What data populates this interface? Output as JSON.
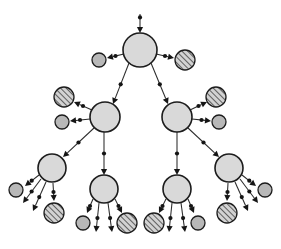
{
  "diagram": {
    "canvas": {
      "width": 281,
      "height": 249,
      "background": "#ffffff"
    },
    "style": {
      "big_node_fill": "#d9d9d9",
      "small_node_fill": "#b8b8b8",
      "hatch_stroke": "#4a4a4a",
      "hatch_background": "#d2d2d2",
      "node_stroke": "#1c1c1c",
      "edge_stroke": "#2b2b2b",
      "marker_fill": "#151515"
    },
    "legend": {
      "big_node_label": "large light-gray circle",
      "small_node_label": "small gray circle",
      "hatch_node_label": "diagonally hatched circle",
      "edge_label": "directed edge with midpoint dot and arrowhead"
    },
    "nodes": [
      {
        "id": "root",
        "kind": "big",
        "cx": 140,
        "cy": 50,
        "r": 17
      },
      {
        "id": "l1",
        "kind": "big",
        "cx": 105,
        "cy": 117,
        "r": 15
      },
      {
        "id": "r1",
        "kind": "big",
        "cx": 177,
        "cy": 117,
        "r": 15
      },
      {
        "id": "l2a",
        "kind": "big",
        "cx": 52,
        "cy": 168,
        "r": 14
      },
      {
        "id": "l2b",
        "kind": "big",
        "cx": 104,
        "cy": 189,
        "r": 14
      },
      {
        "id": "r2a",
        "kind": "big",
        "cx": 177,
        "cy": 189,
        "r": 14
      },
      {
        "id": "r2b",
        "kind": "big",
        "cx": 229,
        "cy": 168,
        "r": 14
      },
      {
        "id": "root-leaf-left",
        "kind": "small",
        "cx": 99,
        "cy": 60,
        "r": 7
      },
      {
        "id": "root-leaf-right",
        "kind": "hatch",
        "cx": 185,
        "cy": 60,
        "r": 10
      },
      {
        "id": "l1-leaf-a",
        "kind": "hatch",
        "cx": 64,
        "cy": 97,
        "r": 10
      },
      {
        "id": "l1-leaf-b",
        "kind": "small",
        "cx": 62,
        "cy": 122,
        "r": 7
      },
      {
        "id": "r1-leaf-a",
        "kind": "hatch",
        "cx": 216,
        "cy": 97,
        "r": 10
      },
      {
        "id": "r1-leaf-b",
        "kind": "small",
        "cx": 219,
        "cy": 122,
        "r": 7
      },
      {
        "id": "l2a-leaf-1",
        "kind": "small",
        "cx": 16,
        "cy": 190,
        "r": 7
      },
      {
        "id": "l2a-leaf-4",
        "kind": "hatch",
        "cx": 54,
        "cy": 213,
        "r": 10
      },
      {
        "id": "l2b-leaf-1",
        "kind": "small",
        "cx": 83,
        "cy": 223,
        "r": 7
      },
      {
        "id": "l2b-leaf-4",
        "kind": "hatch",
        "cx": 127,
        "cy": 223,
        "r": 10
      },
      {
        "id": "r2a-leaf-1",
        "kind": "hatch",
        "cx": 154,
        "cy": 223,
        "r": 10
      },
      {
        "id": "r2a-leaf-4",
        "kind": "small",
        "cx": 198,
        "cy": 223,
        "r": 7
      },
      {
        "id": "r2b-leaf-1",
        "kind": "small",
        "cx": 265,
        "cy": 190,
        "r": 7
      },
      {
        "id": "r2b-leaf-4",
        "kind": "hatch",
        "cx": 227,
        "cy": 213,
        "r": 10
      }
    ],
    "edges": [
      {
        "from": "external-top",
        "to": "root",
        "x1": 140,
        "y1": 14,
        "x2": 140,
        "y2": 33,
        "dot_at": 0.18,
        "arrow": true
      },
      {
        "from": "root",
        "to": "root-leaf-left",
        "x1": 124,
        "y1": 54,
        "x2": 107,
        "y2": 58,
        "dot_at": 0.5,
        "arrow": true
      },
      {
        "from": "root",
        "to": "root-leaf-right",
        "x1": 156,
        "y1": 54,
        "x2": 174,
        "y2": 58,
        "dot_at": 0.5,
        "arrow": true
      },
      {
        "from": "root",
        "to": "l1",
        "x1": 129,
        "y1": 63,
        "x2": 113,
        "y2": 104,
        "dot_at": 0.52,
        "arrow": true
      },
      {
        "from": "root",
        "to": "r1",
        "x1": 151,
        "y1": 63,
        "x2": 168,
        "y2": 104,
        "dot_at": 0.52,
        "arrow": true
      },
      {
        "from": "l1",
        "to": "l1-leaf-a",
        "x1": 92,
        "y1": 110,
        "x2": 74,
        "y2": 102,
        "dot_at": 0.5,
        "arrow": true
      },
      {
        "from": "l1",
        "to": "l1-leaf-b",
        "x1": 90,
        "y1": 119,
        "x2": 70,
        "y2": 121,
        "dot_at": 0.5,
        "arrow": true
      },
      {
        "from": "r1",
        "to": "r1-leaf-a",
        "x1": 190,
        "y1": 110,
        "x2": 207,
        "y2": 102,
        "dot_at": 0.5,
        "arrow": true
      },
      {
        "from": "r1",
        "to": "r1-leaf-b",
        "x1": 192,
        "y1": 119,
        "x2": 211,
        "y2": 121,
        "dot_at": 0.5,
        "arrow": true
      },
      {
        "from": "l1",
        "to": "l2a",
        "x1": 94,
        "y1": 128,
        "x2": 63,
        "y2": 157,
        "dot_at": 0.5,
        "arrow": true
      },
      {
        "from": "l1",
        "to": "l2b",
        "x1": 104,
        "y1": 132,
        "x2": 104,
        "y2": 175,
        "dot_at": 0.5,
        "arrow": true
      },
      {
        "from": "r1",
        "to": "r2a",
        "x1": 177,
        "y1": 132,
        "x2": 177,
        "y2": 175,
        "dot_at": 0.5,
        "arrow": true
      },
      {
        "from": "r1",
        "to": "r2b",
        "x1": 188,
        "y1": 128,
        "x2": 219,
        "y2": 157,
        "dot_at": 0.5,
        "arrow": true
      },
      {
        "from": "l2a",
        "to": "l2a-leaf-1",
        "x1": 39,
        "y1": 175,
        "x2": 25,
        "y2": 186,
        "dot_at": 0.52,
        "arrow": true
      },
      {
        "from": "l2a",
        "to": "l2a-leaf-2",
        "x1": 41,
        "y1": 179,
        "x2": 23,
        "y2": 203,
        "dot_at": 0.52,
        "arrow": true
      },
      {
        "from": "l2a",
        "to": "l2a-leaf-3",
        "x1": 46,
        "y1": 182,
        "x2": 33,
        "y2": 211,
        "dot_at": 0.52,
        "arrow": true
      },
      {
        "from": "l2a",
        "to": "l2a-leaf-4",
        "x1": 53,
        "y1": 183,
        "x2": 54,
        "y2": 201,
        "dot_at": 0.5,
        "arrow": true
      },
      {
        "from": "l2b",
        "to": "l2b-leaf-1",
        "x1": 93,
        "y1": 199,
        "x2": 87,
        "y2": 213,
        "dot_at": 0.5,
        "arrow": true
      },
      {
        "from": "l2b",
        "to": "l2b-leaf-2",
        "x1": 99,
        "y1": 203,
        "x2": 96,
        "y2": 232,
        "dot_at": 0.52,
        "arrow": true
      },
      {
        "from": "l2b",
        "to": "l2b-leaf-3",
        "x1": 108,
        "y1": 203,
        "x2": 112,
        "y2": 232,
        "dot_at": 0.52,
        "arrow": true
      },
      {
        "from": "l2b",
        "to": "l2b-leaf-4",
        "x1": 115,
        "y1": 199,
        "x2": 122,
        "y2": 213,
        "dot_at": 0.5,
        "arrow": true
      },
      {
        "from": "r2a",
        "to": "r2a-leaf-1",
        "x1": 166,
        "y1": 199,
        "x2": 159,
        "y2": 213,
        "dot_at": 0.5,
        "arrow": true
      },
      {
        "from": "r2a",
        "to": "r2a-leaf-2",
        "x1": 172,
        "y1": 203,
        "x2": 169,
        "y2": 232,
        "dot_at": 0.52,
        "arrow": true
      },
      {
        "from": "r2a",
        "to": "r2a-leaf-3",
        "x1": 181,
        "y1": 203,
        "x2": 185,
        "y2": 232,
        "dot_at": 0.52,
        "arrow": true
      },
      {
        "from": "r2a",
        "to": "r2a-leaf-4",
        "x1": 188,
        "y1": 199,
        "x2": 194,
        "y2": 213,
        "dot_at": 0.5,
        "arrow": true
      },
      {
        "from": "r2b",
        "to": "r2b-leaf-1",
        "x1": 242,
        "y1": 175,
        "x2": 256,
        "y2": 186,
        "dot_at": 0.52,
        "arrow": true
      },
      {
        "from": "r2b",
        "to": "r2b-leaf-2",
        "x1": 240,
        "y1": 179,
        "x2": 258,
        "y2": 203,
        "dot_at": 0.52,
        "arrow": true
      },
      {
        "from": "r2b",
        "to": "r2b-leaf-3",
        "x1": 235,
        "y1": 182,
        "x2": 248,
        "y2": 211,
        "dot_at": 0.52,
        "arrow": true
      },
      {
        "from": "r2b",
        "to": "r2b-leaf-4",
        "x1": 228,
        "y1": 183,
        "x2": 227,
        "y2": 201,
        "dot_at": 0.5,
        "arrow": true
      }
    ],
    "counts": {
      "big_nodes": 7,
      "small_nodes": 8,
      "hatched_nodes": 8,
      "edges": 29,
      "levels": 4
    }
  }
}
